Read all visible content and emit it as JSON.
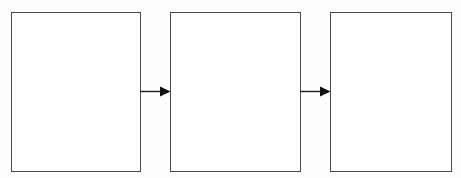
{
  "diagram": {
    "type": "flow-diagram",
    "orientation": "horizontal",
    "background_color": "#fdfdfd",
    "stroke_color": "#4a4a4a",
    "arrow_color": "#1a1a1a",
    "boxes": [
      {
        "id": "box-1",
        "label": "",
        "shape": "rectangle",
        "fill": "#ffffff"
      },
      {
        "id": "box-2",
        "label": "",
        "shape": "rectangle",
        "fill": "#ffffff"
      },
      {
        "id": "box-3",
        "label": "",
        "shape": "rectangle",
        "fill": "#ffffff"
      }
    ],
    "connectors": [
      {
        "id": "arrow-1",
        "from": "box-1",
        "to": "box-2",
        "style": "solid-line-filled-arrowhead",
        "direction": "right"
      },
      {
        "id": "arrow-2",
        "from": "box-2",
        "to": "box-3",
        "style": "solid-line-filled-arrowhead",
        "direction": "right"
      }
    ]
  }
}
